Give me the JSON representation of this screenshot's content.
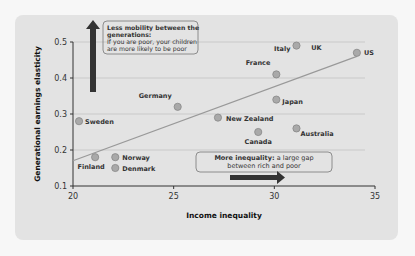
{
  "chart_data": {
    "type": "scatter",
    "title": "",
    "xlabel": "Income inequality",
    "ylabel": "Generational earnings elasticity",
    "xlim": [
      20,
      35
    ],
    "ylim": [
      0.1,
      0.5
    ],
    "xticks": [
      "20",
      "25",
      "30",
      "35"
    ],
    "yticks": [
      "0.1",
      "0.2",
      "0.3",
      "0.4",
      "0.5"
    ],
    "grid": true,
    "points": [
      {
        "label": "Sweden",
        "x": 20.3,
        "y": 0.28
      },
      {
        "label": "Finland",
        "x": 21.1,
        "y": 0.18
      },
      {
        "label": "Norway",
        "x": 22.1,
        "y": 0.18
      },
      {
        "label": "Denmark",
        "x": 22.1,
        "y": 0.15
      },
      {
        "label": "Germany",
        "x": 25.2,
        "y": 0.32
      },
      {
        "label": "New Zealand",
        "x": 27.2,
        "y": 0.29
      },
      {
        "label": "Canada",
        "x": 29.2,
        "y": 0.25
      },
      {
        "label": "Japan",
        "x": 30.1,
        "y": 0.34
      },
      {
        "label": "France",
        "x": 30.1,
        "y": 0.41
      },
      {
        "label": "Australia",
        "x": 31.1,
        "y": 0.26
      },
      {
        "label": "Italy",
        "x": 31.1,
        "y": 0.49
      },
      {
        "label": "UK",
        "x": 31.1,
        "y": 0.49
      },
      {
        "label": "US",
        "x": 34.1,
        "y": 0.47
      }
    ],
    "trendline": {
      "x": [
        20,
        34.1
      ],
      "y": [
        0.17,
        0.46
      ]
    },
    "annotations": [
      {
        "bold": "Less mobility between the generations:",
        "text": "If you are poor, your children are more likely to be poor",
        "arrow": "up"
      },
      {
        "bold": "More inequality:",
        "text": "a large gap between rich and poor",
        "arrow": "right"
      }
    ]
  }
}
